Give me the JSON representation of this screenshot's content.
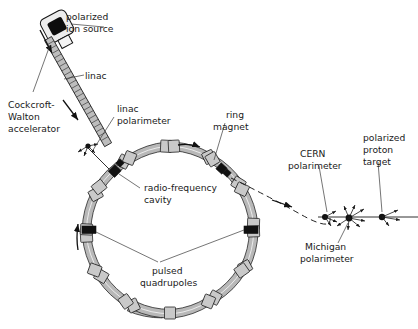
{
  "figure": {
    "type": "schematic-diagram"
  },
  "labels": {
    "polarized_ion_source": "polarized\nion source",
    "polarized_ion_source_l1": "polarized",
    "polarized_ion_source_l2": "ion source",
    "linac": "linac",
    "cockcroft_walton_l1": "Cockcroft-",
    "cockcroft_walton_l2": "Walton",
    "cockcroft_walton_l3": "accelerator",
    "linac_polarimeter_l1": "linac",
    "linac_polarimeter_l2": "polarimeter",
    "ring_magnet_l1": "ring",
    "ring_magnet_l2": "magnet",
    "radio_frequency_cavity_l1": "radio-frequency",
    "radio_frequency_cavity_l2": "cavity",
    "pulsed_quadrupoles_l1": "pulsed",
    "pulsed_quadrupoles_l2": "quadrupoles",
    "cern_polarimeter_l1": "CERN",
    "cern_polarimeter_l2": "polarimeter",
    "michigan_polarimeter_l1": "Michigan",
    "michigan_polarimeter_l2": "polarimeter",
    "polarized_proton_target_l1": "polarized",
    "polarized_proton_target_l2": "proton",
    "polarized_proton_target_l3": "target"
  },
  "components": {
    "ring": {
      "center_x": 170,
      "center_y": 230,
      "radius": 88,
      "magnet_count": 12,
      "label": "storage ring"
    },
    "ion_source": {
      "x": 40,
      "y": 18,
      "label": "polarized ion source"
    },
    "linac": {
      "x1": 48,
      "y1": 38,
      "x2": 110,
      "y2": 148,
      "label": "linac accelerating column"
    },
    "extraction_line": {
      "label": "extracted beam to experimental area"
    }
  },
  "colors": {
    "background": "#ffffff",
    "ink": "#1a1a1a",
    "magnet_fill": "#b8b8b8",
    "dark_block": "#111111",
    "leader": "#3a3a3a"
  }
}
